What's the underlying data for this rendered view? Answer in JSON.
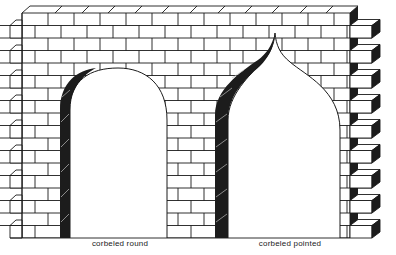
{
  "figure": {
    "colors": {
      "line": "#1a1a1a",
      "shade": "#1c1c1c",
      "brick": "#ffffff",
      "background": "#ffffff"
    },
    "arches": [
      {
        "id": "round",
        "label": "corbeled round",
        "label_x": 120
      },
      {
        "id": "pointed",
        "label": "corbeled pointed",
        "label_x": 290
      }
    ]
  }
}
